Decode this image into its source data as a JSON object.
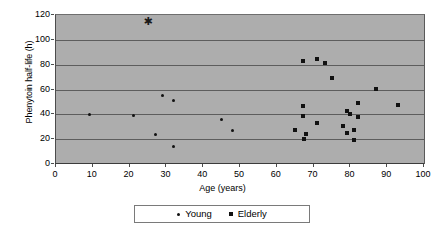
{
  "chart_data": {
    "type": "scatter",
    "title": "",
    "xlabel": "Age (years)",
    "ylabel": "Phenytoin half-life (h)",
    "xlim": [
      0,
      100
    ],
    "ylim": [
      0,
      120
    ],
    "xticks": [
      0,
      10,
      20,
      30,
      40,
      50,
      60,
      70,
      80,
      90,
      100
    ],
    "yticks": [
      0,
      20,
      40,
      60,
      80,
      100,
      120
    ],
    "grid": "horizontal",
    "plot_background": "#adadad",
    "gridline_color": "#5d5d5d",
    "marker_color": "#111111",
    "legend_position": "below-axis-centered",
    "series": [
      {
        "name": "Young",
        "marker": "diamond",
        "points": [
          {
            "x": 9,
            "y": 40
          },
          {
            "x": 21,
            "y": 39
          },
          {
            "x": 27,
            "y": 24
          },
          {
            "x": 29,
            "y": 55
          },
          {
            "x": 32,
            "y": 51
          },
          {
            "x": 32,
            "y": 14
          },
          {
            "x": 45,
            "y": 36
          },
          {
            "x": 48,
            "y": 27
          }
        ]
      },
      {
        "name": "Elderly",
        "marker": "square",
        "points": [
          {
            "x": 65,
            "y": 27
          },
          {
            "x": 67,
            "y": 83
          },
          {
            "x": 67,
            "y": 47
          },
          {
            "x": 67,
            "y": 39
          },
          {
            "x": 67.5,
            "y": 20.5
          },
          {
            "x": 68,
            "y": 24.5
          },
          {
            "x": 71,
            "y": 84.5
          },
          {
            "x": 71,
            "y": 33
          },
          {
            "x": 73,
            "y": 81
          },
          {
            "x": 75,
            "y": 69
          },
          {
            "x": 78,
            "y": 31
          },
          {
            "x": 79,
            "y": 43
          },
          {
            "x": 79,
            "y": 25
          },
          {
            "x": 80,
            "y": 40
          },
          {
            "x": 81,
            "y": 27.5
          },
          {
            "x": 81,
            "y": 19
          },
          {
            "x": 82,
            "y": 49
          },
          {
            "x": 82,
            "y": 38
          },
          {
            "x": 87,
            "y": 60.5
          },
          {
            "x": 93,
            "y": 47.5
          }
        ]
      },
      {
        "name": "Outlier",
        "marker": "asterisk",
        "glyph": "✱",
        "points": [
          {
            "x": 25,
            "y": 115
          }
        ]
      }
    ]
  },
  "legend": {
    "entries": [
      {
        "label": "Young",
        "marker": "diamond"
      },
      {
        "label": "Elderly",
        "marker": "square"
      }
    ]
  }
}
